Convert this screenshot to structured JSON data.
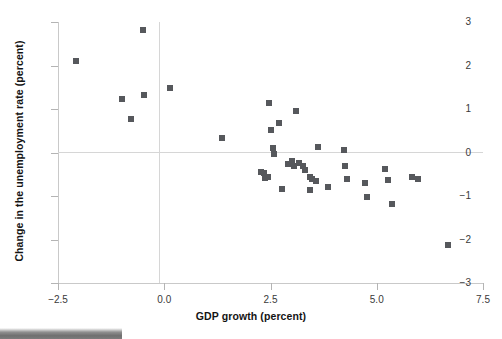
{
  "figure": {
    "title": "",
    "background": "#ffffff",
    "marker_color": "#56585c",
    "axis_color": "#c9c9c9",
    "grid_color": "#d6d6d6"
  },
  "axes": {
    "xlabel": "GDP growth (percent)",
    "ylabel": "Change in the unemployment rate (percent)",
    "xticks": [
      "-2.5",
      "0.0",
      "2.5",
      "5.0",
      "7.5"
    ],
    "yticks": [
      "3",
      "2",
      "1",
      "0",
      "-1",
      "-2",
      "-3"
    ]
  },
  "artifact": {
    "name": "scan-edge-band"
  },
  "chart_data": {
    "type": "scatter",
    "title": "",
    "xlabel": "GDP growth (percent)",
    "ylabel": "Change in the unemployment rate (percent)",
    "xlim": [
      -2.5,
      7.5
    ],
    "ylim": [
      -3,
      3
    ],
    "xticks": [
      -2.5,
      0.0,
      2.5,
      5.0,
      7.5
    ],
    "yticks": [
      3,
      2,
      1,
      0,
      -1,
      -2,
      -3
    ],
    "grid": false,
    "reference_lines": {
      "x": 0.0,
      "y": 0.0
    },
    "legend": null,
    "marker": "square",
    "points": [
      {
        "x": -2.07,
        "y": 2.1
      },
      {
        "x": -1.0,
        "y": 1.22
      },
      {
        "x": -0.79,
        "y": 0.78
      },
      {
        "x": -0.51,
        "y": 2.82
      },
      {
        "x": -0.47,
        "y": 1.33
      },
      {
        "x": 0.14,
        "y": 1.48
      },
      {
        "x": 1.35,
        "y": 0.33
      },
      {
        "x": 2.27,
        "y": -0.44
      },
      {
        "x": 2.34,
        "y": -0.48
      },
      {
        "x": 2.38,
        "y": -0.58
      },
      {
        "x": 2.43,
        "y": -0.56
      },
      {
        "x": 2.47,
        "y": 1.14
      },
      {
        "x": 2.52,
        "y": 0.52
      },
      {
        "x": 2.56,
        "y": 0.1
      },
      {
        "x": 2.58,
        "y": -0.03
      },
      {
        "x": 2.71,
        "y": 0.68
      },
      {
        "x": 2.78,
        "y": -0.85
      },
      {
        "x": 2.9,
        "y": -0.26
      },
      {
        "x": 3.01,
        "y": -0.2
      },
      {
        "x": 3.06,
        "y": -0.31
      },
      {
        "x": 3.11,
        "y": 0.95
      },
      {
        "x": 3.17,
        "y": -0.23
      },
      {
        "x": 3.26,
        "y": -0.3
      },
      {
        "x": 3.31,
        "y": -0.41
      },
      {
        "x": 3.42,
        "y": -0.86
      },
      {
        "x": 3.44,
        "y": -0.56
      },
      {
        "x": 3.48,
        "y": -0.6
      },
      {
        "x": 3.56,
        "y": -0.65
      },
      {
        "x": 3.62,
        "y": 0.12
      },
      {
        "x": 3.86,
        "y": -0.8
      },
      {
        "x": 4.24,
        "y": 0.05
      },
      {
        "x": 4.26,
        "y": -0.3
      },
      {
        "x": 4.3,
        "y": -0.62
      },
      {
        "x": 4.73,
        "y": -0.7
      },
      {
        "x": 4.77,
        "y": -1.02
      },
      {
        "x": 5.19,
        "y": -0.37
      },
      {
        "x": 5.26,
        "y": -0.63
      },
      {
        "x": 5.35,
        "y": -1.18
      },
      {
        "x": 5.83,
        "y": -0.57
      },
      {
        "x": 5.98,
        "y": -0.62
      },
      {
        "x": 6.67,
        "y": -2.13
      }
    ]
  }
}
